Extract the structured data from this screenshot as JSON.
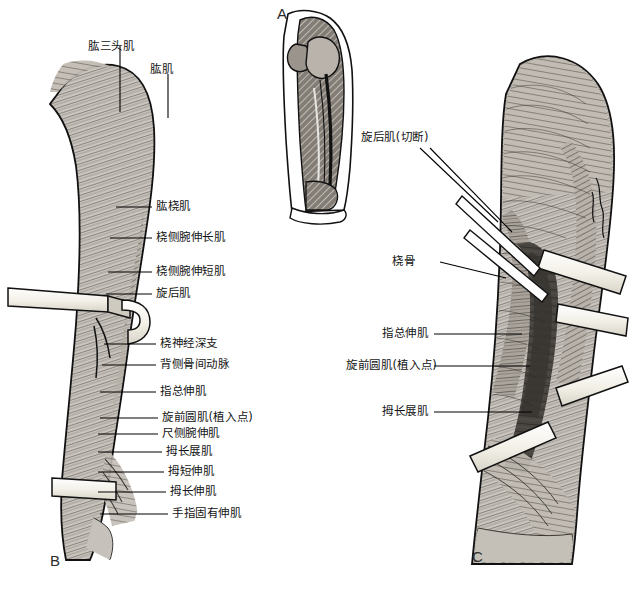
{
  "figure": {
    "background_color": "#ffffff",
    "ink_color": "#111111",
    "panels": [
      {
        "id": "A",
        "letter": "A",
        "caption": ""
      },
      {
        "id": "B",
        "letter": "B",
        "caption": ""
      },
      {
        "id": "C",
        "letter": "C",
        "caption": ""
      }
    ]
  },
  "panel_a": {
    "letter": "A",
    "description": "small-forearm-bone-diagram"
  },
  "panel_b": {
    "letter": "B",
    "labels": [
      {
        "text": "肱三头肌",
        "leader": "vertical"
      },
      {
        "text": "肱肌",
        "leader": "vertical"
      },
      {
        "text": "肱桡肌",
        "leader": "horizontal"
      },
      {
        "text": "桡侧腕伸长肌",
        "leader": "horizontal"
      },
      {
        "text": "桡侧腕伸短肌",
        "leader": "horizontal"
      },
      {
        "text": "旋后肌",
        "leader": "horizontal"
      },
      {
        "text": "桡神经深支",
        "leader": "horizontal"
      },
      {
        "text": "背侧骨间动脉",
        "leader": "horizontal"
      },
      {
        "text": "指总伸肌",
        "leader": "horizontal"
      },
      {
        "text": "旋前圆肌(植入点)",
        "leader": "horizontal"
      },
      {
        "text": "尺侧腕伸肌",
        "leader": "horizontal"
      },
      {
        "text": "拇长展肌",
        "leader": "horizontal"
      },
      {
        "text": "拇短伸肌",
        "leader": "horizontal"
      },
      {
        "text": "拇长伸肌",
        "leader": "horizontal"
      },
      {
        "text": "手指固有伸肌",
        "leader": "horizontal"
      }
    ]
  },
  "panel_c": {
    "letter": "C",
    "labels": [
      {
        "text": "旋后肌(切断)",
        "leader": "diagonal"
      },
      {
        "text": "桡骨",
        "leader": "diagonal"
      },
      {
        "text": "指总伸肌",
        "leader": "horizontal"
      },
      {
        "text": "旋前圆肌(植入点)",
        "leader": "horizontal"
      },
      {
        "text": "拇长展肌",
        "leader": "horizontal"
      }
    ]
  },
  "colors": {
    "paper": "#ffffff",
    "line": "#000000",
    "muscle_light": "#c9c4bd",
    "muscle_mid": "#9b948c",
    "muscle_dark": "#4a4540",
    "deep_shadow": "#3a3733",
    "retractor": "#efece3",
    "bone_hatch": "#7d7870"
  }
}
